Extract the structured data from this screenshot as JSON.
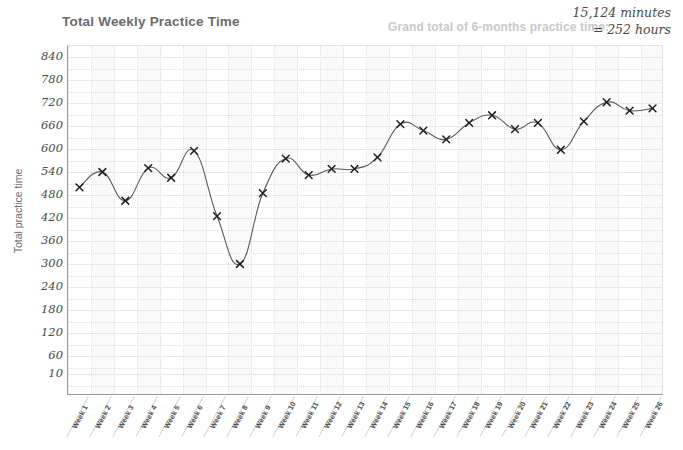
{
  "header": {
    "title": "Total Weekly Practice Time",
    "grand_total_label": "Grand total of 6-months practice time:",
    "grand_total_minutes": "15,124 minutes",
    "grand_total_hours": "= 252 hours"
  },
  "colors": {
    "line": "#5a5a5a",
    "marker": "#1f1f1f",
    "grid_major": "#e6e6e6",
    "grid_minor": "#dcdcdc",
    "axis": "#9a9a9a",
    "title_text": "#6b6b6b",
    "muted_text": "#c9c9c9",
    "tick_text": "#4a4a4a",
    "band": "#fafafa"
  },
  "chart_data": {
    "type": "line",
    "title": "Total Weekly Practice Time",
    "xlabel": "",
    "ylabel": "Total practice time",
    "ylim": [
      10,
      840
    ],
    "yticks": [
      840,
      780,
      720,
      660,
      600,
      540,
      480,
      420,
      360,
      300,
      240,
      180,
      120,
      60,
      10
    ],
    "grid": true,
    "legend": "none",
    "marker_style": "x",
    "categories": [
      "Week 1",
      "Week 2",
      "Week 3",
      "Week 4",
      "Week 5",
      "Week 6",
      "Week 7",
      "Week 8",
      "Week 9",
      "Week 10",
      "Week 11",
      "Week 12",
      "Week 13",
      "Week 14",
      "Week 15",
      "Week 16",
      "Week 17",
      "Week 18",
      "Week 19",
      "Week 20",
      "Week 21",
      "Week 22",
      "Week 23",
      "Week 24",
      "Week 25",
      "Week 26"
    ],
    "values": [
      500,
      540,
      465,
      550,
      525,
      595,
      425,
      300,
      485,
      575,
      532,
      548,
      548,
      578,
      665,
      648,
      625,
      668,
      688,
      652,
      668,
      598,
      672,
      722,
      700,
      706
    ],
    "annotations": [
      "Grand total of 6-months practice time:",
      "15,124 minutes",
      "= 252 hours"
    ]
  }
}
